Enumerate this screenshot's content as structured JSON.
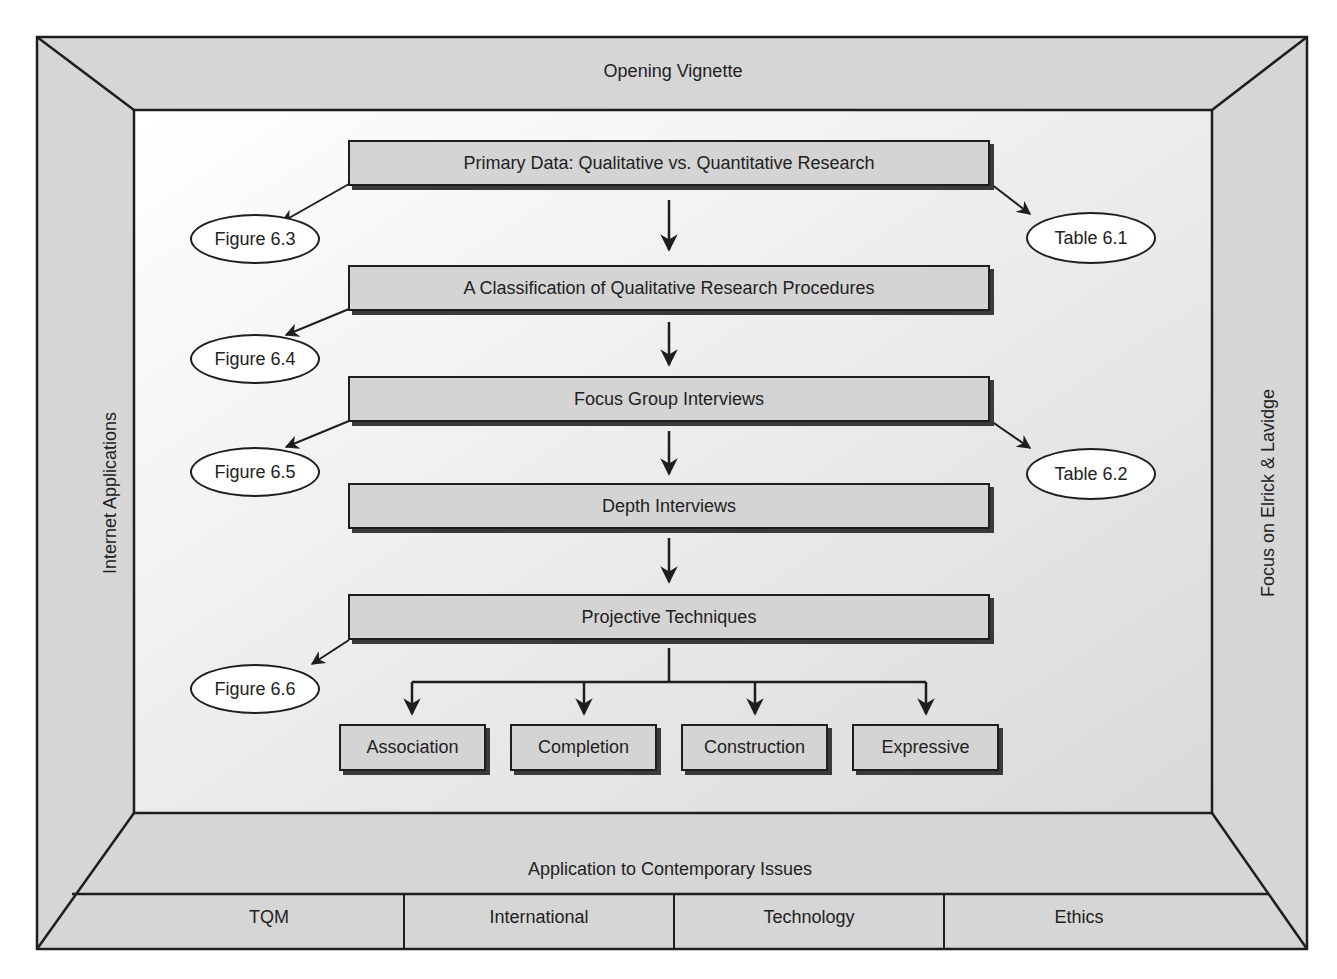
{
  "frame": {
    "top": "Opening Vignette",
    "left": "Internet Applications",
    "right": "Focus on Elrick & Lavidge",
    "bottom": "Application to Contemporary Issues",
    "bottom_cells": [
      "TQM",
      "International",
      "Technology",
      "Ethics"
    ]
  },
  "flow": {
    "steps": [
      "Primary Data: Qualitative vs. Quantitative Research",
      "A Classification of Qualitative Research Procedures",
      "Focus Group Interviews",
      "Depth Interviews",
      "Projective Techniques"
    ],
    "projective_types": [
      "Association",
      "Completion",
      "Construction",
      "Expressive"
    ]
  },
  "references": {
    "left": [
      "Figure 6.3",
      "Figure 6.4",
      "Figure 6.5",
      "Figure 6.6"
    ],
    "right": [
      "Table 6.1",
      "Table 6.2"
    ]
  },
  "colors": {
    "frame_fill": "#d6d6d6",
    "box_fill": "#d4d4d4",
    "inner_bg": "#eeeeee",
    "stroke": "#1e1e1e"
  }
}
